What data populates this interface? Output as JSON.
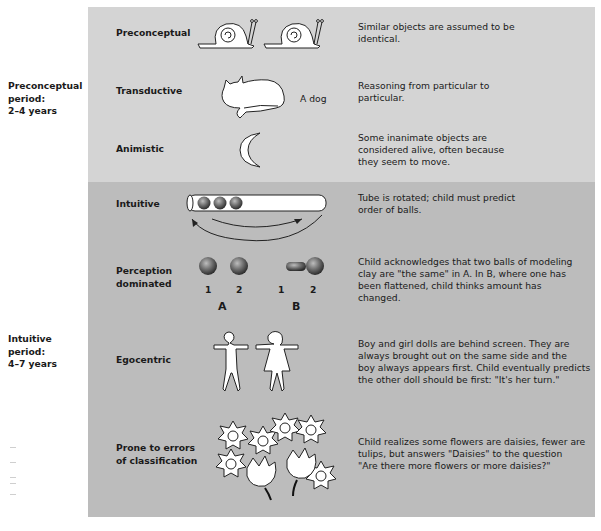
{
  "periods": [
    {
      "label": "Preconceptual period:",
      "line1": "Preconceptual",
      "line2": "period:",
      "line3": "2–4 years"
    },
    {
      "label": "Intuitive period:",
      "line1": "Intuitive",
      "line2": "period:",
      "line3": "4–7 years"
    }
  ],
  "rows": [
    {
      "stage": "Preconceptual",
      "stage2": "",
      "description": "Similar objects are assumed to be identical.",
      "desc_lines": [
        "Similar objects are assumed to be",
        "identical."
      ],
      "illustration": "two-snails"
    },
    {
      "stage": "Transductive",
      "stage2": "",
      "description": "Reasoning from particular to particular.",
      "desc_lines": [
        "Reasoning from particular to",
        "particular."
      ],
      "illustration": "cat",
      "caption": "A dog"
    },
    {
      "stage": "Animistic",
      "stage2": "",
      "description": "Some inanimate objects are considered alive, often because they seem to move.",
      "desc_lines": [
        "Some inanimate objects are",
        "considered alive, often because",
        "they seem to move."
      ],
      "illustration": "crescent-moon"
    },
    {
      "stage": "Intuitive",
      "stage2": "",
      "description": "Tube is rotated; child must predict order of balls.",
      "desc_lines": [
        "Tube is rotated; child must predict",
        "order of balls."
      ],
      "illustration": "tube-with-balls"
    },
    {
      "stage": "Perception",
      "stage2": "dominated",
      "description": "Child acknowledges that two balls of modeling clay are \"the same\" in A. In B, where one has been flattened, child thinks amount has changed.",
      "desc_lines": [
        "Child acknowledges that two balls of modeling",
        "clay are \"the same\" in A. In B, where one has",
        "been flattened, child thinks amount has",
        "changed."
      ],
      "illustration": "clay-balls",
      "labels": {
        "a1": "1",
        "a2": "2",
        "b1": "1",
        "b2": "2",
        "groupA": "A",
        "groupB": "B"
      }
    },
    {
      "stage": "Egocentric",
      "stage2": "",
      "description": "Boy and girl dolls are behind screen. They are always brought out on the same side and the boy always appears first. Child eventually predicts the other doll should be first: \"It's her turn.\"",
      "desc_lines": [
        "Boy and girl dolls are behind screen. They are",
        "always brought out on the same side and the",
        "boy always appears first. Child eventually predicts",
        "the other doll should be first: \"It's her turn.\""
      ],
      "illustration": "boy-girl-dolls"
    },
    {
      "stage": "Prone to errors",
      "stage2": "of classification",
      "description": "Child realizes some flowers are daisies, fewer are tulips, but answers \"Daisies\" to the question \"Are there more flowers or more daisies?\"",
      "desc_lines": [
        "Child realizes some flowers are daisies, fewer are",
        "tulips, but answers \"Daisies\" to the question",
        "\"Are there more flowers or more daisies?\""
      ],
      "illustration": "daisies-and-tulips"
    }
  ],
  "colors": {
    "top_panel": "#d4d4d4",
    "bottom_panel": "#bcbcbc"
  }
}
